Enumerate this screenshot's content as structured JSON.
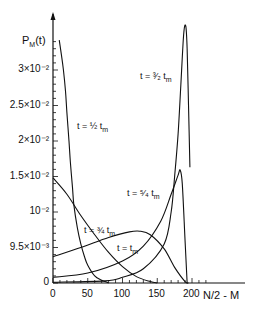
{
  "chart_data": {
    "type": "line",
    "title": "",
    "xlabel": "N/2 - M",
    "ylabel": "P_M(t)",
    "xlim": [
      0,
      210
    ],
    "ylim": [
      0,
      0.037
    ],
    "grid": false,
    "legend": "none (inline curve labels)",
    "x_ticks": [
      0,
      50,
      100,
      150,
      200
    ],
    "x_tick_labels": [
      "0",
      "50",
      "100",
      "150",
      "200"
    ],
    "y_ticks": [
      0,
      0.005,
      0.01,
      0.015,
      0.02,
      0.025,
      0.03
    ],
    "y_tick_labels": [
      "0",
      "9.5×10⁻³",
      "10⁻²",
      "1.5×10⁻²",
      "2×10⁻²",
      "2.5×10⁻²",
      "3×10⁻²"
    ],
    "series": [
      {
        "name": "t = 1/2 t_m",
        "label": "t = ½ t",
        "sub": "m",
        "x": [
          9,
          12,
          15,
          18,
          20,
          23,
          25,
          28,
          30,
          35,
          40,
          45,
          50,
          60,
          70,
          75,
          80
        ],
        "y": [
          0.0342,
          0.0322,
          0.03,
          0.027,
          0.024,
          0.02,
          0.017,
          0.0135,
          0.011,
          0.0078,
          0.0055,
          0.0038,
          0.0025,
          0.001,
          0.0004,
          0.0002,
          0
        ]
      },
      {
        "name": "t = 3/4 t_m",
        "label": "t = ¾ t",
        "sub": "m",
        "x": [
          0,
          20,
          40,
          60,
          80,
          100,
          120,
          140,
          150
        ],
        "y": [
          0.0148,
          0.0125,
          0.0095,
          0.0068,
          0.0043,
          0.0023,
          0.0009,
          0.0002,
          0
        ]
      },
      {
        "name": "t = t_m",
        "label": "t = t",
        "sub": "m",
        "x": [
          0,
          40,
          80,
          110,
          125,
          140,
          160,
          175,
          190,
          195
        ],
        "y": [
          0.0037,
          0.005,
          0.0064,
          0.0072,
          0.0073,
          0.0068,
          0.0048,
          0.0022,
          0.0002,
          0
        ]
      },
      {
        "name": "t = 5/4 t_m",
        "label": "t = ⁵⁄₄ t",
        "sub": "m",
        "x": [
          0,
          50,
          100,
          130,
          155,
          170,
          180,
          183,
          186,
          190,
          193
        ],
        "y": [
          0.0008,
          0.0014,
          0.0031,
          0.0052,
          0.0087,
          0.0125,
          0.0152,
          0.0159,
          0.014,
          0.006,
          0
        ]
      },
      {
        "name": "t = 3/2 t_m",
        "label": "t = ³⁄₂ t",
        "sub": "m",
        "x": [
          0,
          75,
          100,
          130,
          160,
          170,
          175,
          180,
          184,
          188,
          191,
          193,
          195,
          197
        ],
        "y": [
          0.0001,
          0.0003,
          0.0008,
          0.002,
          0.0055,
          0.01,
          0.015,
          0.021,
          0.028,
          0.035,
          0.0362,
          0.033,
          0.025,
          0.0163
        ]
      }
    ]
  },
  "labels": {
    "y_axis_title": "P",
    "y_axis_sub": "M",
    "y_axis_arg": "(t)",
    "x_axis_title": "N/2 - M"
  }
}
